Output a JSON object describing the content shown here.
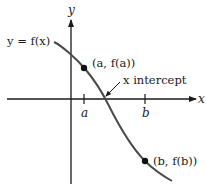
{
  "diagram": {
    "axes": {
      "x_label": "x",
      "y_label": "y"
    },
    "function_label": "y = f(x)",
    "ticks": [
      {
        "label": "a"
      },
      {
        "label": "b"
      }
    ],
    "points": [
      {
        "label": "(a, f(a))"
      },
      {
        "label": "(b, f(b))"
      }
    ],
    "annotation": {
      "label": "x intercept"
    },
    "colors": {
      "axis": "#1a1a1a",
      "curve": "#4a4a4a",
      "point": "#111111",
      "background": "#ffffff"
    }
  }
}
